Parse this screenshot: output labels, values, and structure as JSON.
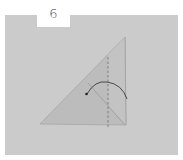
{
  "step": {
    "number": "6"
  },
  "colors": {
    "background": "#ffffff",
    "panel": "#cbcbcb",
    "paper_front": "#b9b9b9",
    "paper_back": "#c2c2c2",
    "line": "#6e6e6e",
    "arrow": "#3a3a3a",
    "step_text": "#4a4a4a"
  },
  "diagram": {
    "shape": "right triangle",
    "fold_line": "dashed vertical",
    "arrow": "curved fold arrow"
  }
}
